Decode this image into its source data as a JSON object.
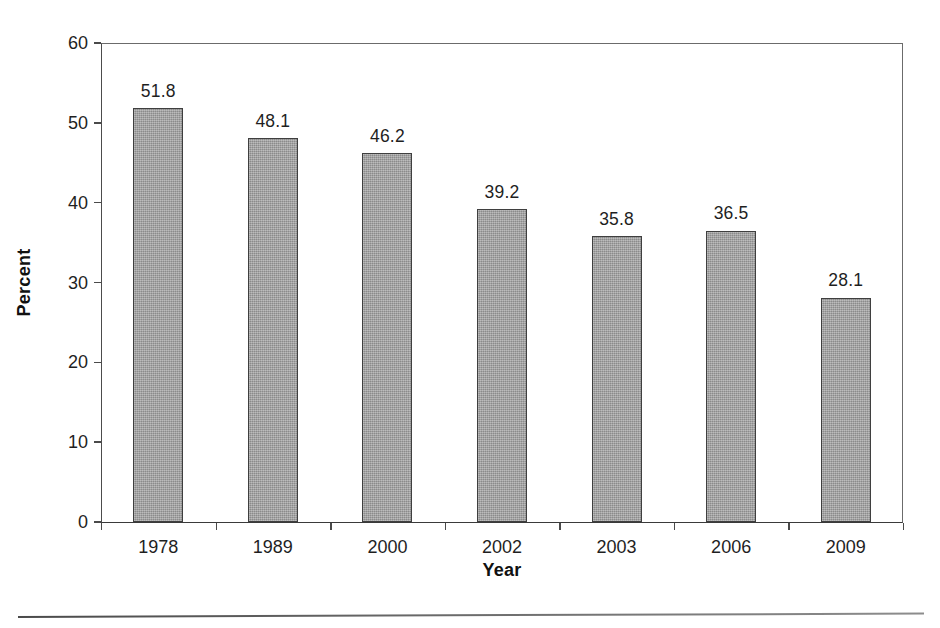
{
  "chart_data": {
    "type": "bar",
    "title": "",
    "subtitle": "",
    "xlabel": "Year",
    "ylabel": "Percent",
    "categories": [
      "1978",
      "1989",
      "2000",
      "2002",
      "2003",
      "2006",
      "2009"
    ],
    "values": [
      51.8,
      48.1,
      46.2,
      39.2,
      35.8,
      36.5,
      28.1
    ],
    "data_labels": [
      "51.8",
      "48.1",
      "46.2",
      "39.2",
      "35.8",
      "36.5",
      "28.1"
    ],
    "ylim": [
      0,
      60
    ],
    "y_ticks": [
      0,
      10,
      20,
      30,
      40,
      50,
      60
    ],
    "y_tick_labels": [
      "0",
      "10",
      "20",
      "30",
      "40",
      "50",
      "60"
    ],
    "grid": false,
    "legend": null,
    "bar_color": "#9b9b9b",
    "bar_edge_color": "#3f3f3f",
    "text_color": "#1f1f1f",
    "background": "#ffffff"
  },
  "axes": {
    "y_title": "Percent",
    "x_title": "Year"
  }
}
